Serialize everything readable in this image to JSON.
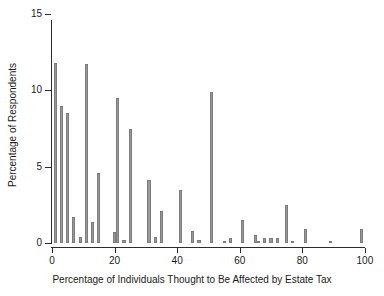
{
  "chart_data": {
    "type": "bar",
    "title": "",
    "xlabel": "Percentage of Individuals Thought to Be Affected by Estate Tax",
    "ylabel": "Percentage of Respondents",
    "xlim": [
      0,
      101
    ],
    "ylim": [
      0,
      15
    ],
    "xticks": [
      0,
      20,
      40,
      60,
      80,
      100
    ],
    "yticks": [
      0,
      5,
      10,
      15
    ],
    "xtick_labels": [
      "0",
      "20",
      "40",
      "60",
      "80",
      "100"
    ],
    "ytick_labels": [
      "0",
      "5",
      "10",
      "15"
    ],
    "grid": false,
    "legend": null,
    "bar_color": "#999999",
    "bar_edge_color": "#7c7c7c",
    "bin_width": 1,
    "categories": [
      1,
      3,
      5,
      7,
      9,
      11,
      13,
      15,
      20,
      21,
      23,
      25,
      31,
      33,
      35,
      41,
      45,
      47,
      51,
      55,
      57,
      61,
      65,
      66,
      68,
      70,
      72,
      75,
      77,
      81,
      89,
      99
    ],
    "values": [
      11.8,
      9.0,
      8.5,
      1.7,
      0.4,
      11.7,
      1.4,
      4.6,
      0.7,
      9.5,
      0.2,
      7.5,
      4.1,
      0.4,
      2.1,
      3.5,
      0.8,
      0.2,
      9.9,
      0.1,
      0.35,
      1.5,
      0.5,
      0.1,
      0.35,
      0.35,
      0.35,
      2.5,
      0.1,
      0.95,
      0.15,
      0.9
    ]
  }
}
